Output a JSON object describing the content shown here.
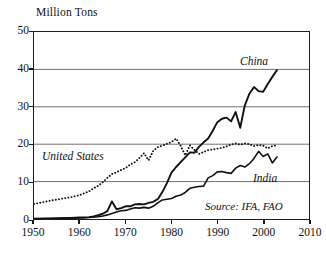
{
  "chart_data": {
    "type": "line",
    "title": "",
    "ylabel": "Million Tons",
    "xlabel": "",
    "xlim": [
      1950,
      2010
    ],
    "ylim": [
      0,
      50
    ],
    "grid": "horizontal",
    "legend_position": "inline-annotations",
    "xticks": [
      "1950",
      "1960",
      "1970",
      "1980",
      "1990",
      "2000",
      "2010"
    ],
    "yticks": [
      "0",
      "10",
      "20",
      "30",
      "40",
      "50"
    ],
    "annotations": {
      "china_label": "China",
      "united_states_label": "United States",
      "india_label": "India",
      "source": "Source: IFA, FAO"
    },
    "series": [
      {
        "name": "China",
        "style": "solid",
        "color": "#111111",
        "width": 1.9,
        "x": [
          1950,
          1955,
          1958,
          1960,
          1961,
          1962,
          1963,
          1964,
          1965,
          1966,
          1967,
          1968,
          1969,
          1970,
          1971,
          1972,
          1973,
          1974,
          1975,
          1976,
          1977,
          1978,
          1979,
          1980,
          1981,
          1982,
          1983,
          1984,
          1985,
          1986,
          1987,
          1988,
          1989,
          1990,
          1991,
          1992,
          1993,
          1994,
          1995,
          1996,
          1997,
          1998,
          1999,
          2000,
          2001,
          2002,
          2003
        ],
        "values": [
          0.1,
          0.2,
          0.3,
          0.4,
          0.4,
          0.5,
          0.7,
          1.0,
          1.4,
          2.1,
          4.7,
          2.6,
          2.9,
          3.4,
          3.4,
          3.9,
          4.0,
          3.9,
          4.3,
          4.6,
          5.3,
          7.2,
          9.6,
          12.4,
          13.9,
          15.2,
          16.5,
          17.8,
          17.7,
          19.3,
          20.5,
          21.5,
          23.6,
          25.9,
          26.8,
          27.1,
          26.1,
          28.6,
          24.4,
          30.4,
          33.5,
          35.3,
          34.2,
          34.0,
          36.1,
          38.0,
          39.8
        ]
      },
      {
        "name": "United States",
        "style": "dotted",
        "color": "#111111",
        "width": 1.9,
        "x": [
          1950,
          1952,
          1954,
          1956,
          1958,
          1960,
          1961,
          1962,
          1963,
          1964,
          1965,
          1966,
          1967,
          1968,
          1969,
          1970,
          1971,
          1972,
          1973,
          1974,
          1975,
          1976,
          1977,
          1978,
          1979,
          1980,
          1981,
          1982,
          1983,
          1984,
          1985,
          1986,
          1987,
          1988,
          1989,
          1990,
          1991,
          1992,
          1993,
          1994,
          1995,
          1996,
          1997,
          1998,
          1999,
          2000,
          2001,
          2002,
          2003
        ],
        "values": [
          4.0,
          4.5,
          5.0,
          5.4,
          5.8,
          6.4,
          6.9,
          7.4,
          8.2,
          8.9,
          9.8,
          11.0,
          12.0,
          12.5,
          13.1,
          13.6,
          14.6,
          15.2,
          16.3,
          17.6,
          15.7,
          18.2,
          19.2,
          19.6,
          20.1,
          20.6,
          21.5,
          19.6,
          17.0,
          19.7,
          18.5,
          17.4,
          17.9,
          18.4,
          18.6,
          18.8,
          19.0,
          19.4,
          19.9,
          20.2,
          19.9,
          20.2,
          20.0,
          19.5,
          19.8,
          19.6,
          18.9,
          19.5,
          19.7
        ]
      },
      {
        "name": "India",
        "style": "solid",
        "color": "#111111",
        "width": 1.6,
        "x": [
          1950,
          1955,
          1960,
          1962,
          1964,
          1965,
          1966,
          1967,
          1968,
          1969,
          1970,
          1971,
          1972,
          1973,
          1974,
          1975,
          1976,
          1977,
          1978,
          1979,
          1980,
          1981,
          1982,
          1983,
          1984,
          1985,
          1986,
          1987,
          1988,
          1989,
          1990,
          1991,
          1992,
          1993,
          1994,
          1995,
          1996,
          1997,
          1998,
          1999,
          2000,
          2001,
          2002,
          2003
        ],
        "values": [
          0.05,
          0.1,
          0.3,
          0.4,
          0.6,
          0.8,
          1.1,
          1.5,
          1.9,
          2.2,
          2.3,
          2.7,
          3.0,
          2.9,
          3.1,
          2.9,
          3.4,
          4.3,
          5.1,
          5.3,
          5.5,
          6.1,
          6.4,
          7.1,
          8.2,
          8.5,
          8.7,
          8.8,
          11.0,
          11.6,
          12.6,
          12.7,
          12.4,
          12.2,
          13.6,
          14.3,
          13.9,
          14.8,
          16.2,
          18.1,
          16.7,
          17.4,
          15.0,
          16.6
        ]
      }
    ]
  }
}
